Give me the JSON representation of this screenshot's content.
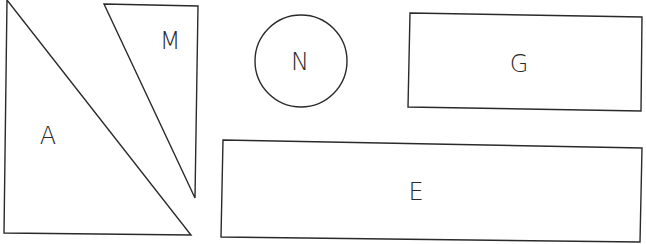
{
  "diagram": {
    "title": "",
    "shapes": [
      {
        "id": "A",
        "type": "right-triangle",
        "label": "A",
        "points": "7,0 4,233 191,235",
        "label_pos": [
          48,
          144
        ]
      },
      {
        "id": "M",
        "type": "triangle",
        "label": "M",
        "points": "104,4 198,6 195,198",
        "label_pos": [
          170,
          49
        ]
      },
      {
        "id": "N",
        "type": "circle",
        "label": "N",
        "cx": 301,
        "cy": 61,
        "r": 46,
        "label_pos": [
          300,
          70
        ]
      },
      {
        "id": "G",
        "type": "rectangle",
        "label": "G",
        "points": "410,13 642,17 641,111 408,107",
        "label_pos": [
          519,
          72
        ]
      },
      {
        "id": "E",
        "type": "rectangle",
        "label": "E",
        "points": "223,140 642,148 640,242 221,237",
        "label_pos": [
          416,
          200
        ]
      }
    ]
  }
}
